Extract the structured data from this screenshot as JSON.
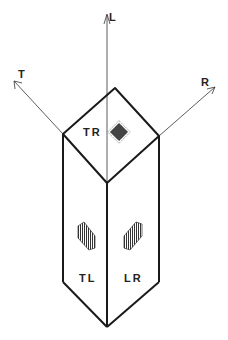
{
  "diagram": {
    "axes": [
      {
        "id": "L",
        "label": "L"
      },
      {
        "id": "T",
        "label": "T"
      },
      {
        "id": "R",
        "label": "R"
      }
    ],
    "faces": [
      {
        "id": "TR",
        "label": "TR"
      },
      {
        "id": "TL",
        "label": "TL"
      },
      {
        "id": "LR",
        "label": "LR"
      }
    ],
    "colors": {
      "line": "#1a1a1a",
      "background": "#ffffff"
    }
  }
}
